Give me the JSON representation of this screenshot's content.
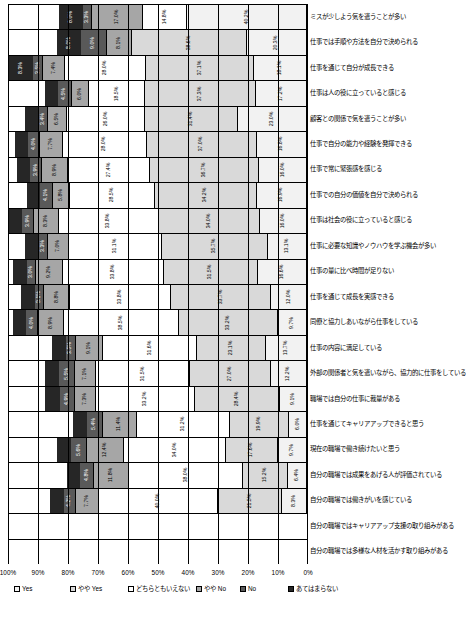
{
  "chart_data": {
    "type": "bar",
    "orientation": "stacked-horizontal-rotated",
    "title": "",
    "xlabel": "",
    "ylabel": "",
    "xlim": [
      0,
      100
    ],
    "grid": true,
    "legend_position": "bottom",
    "axis_ticks": [
      "0%",
      "10%",
      "20%",
      "30%",
      "40%",
      "50%",
      "60%",
      "70%",
      "80%",
      "90%",
      "100%"
    ],
    "legend": [
      "Yes",
      "やや Yes",
      "どちらともいえない",
      "やや No",
      "No",
      "あてはまらない"
    ],
    "categories": [
      "ミスが少しよう気を遣うことが多い",
      "仕事では手順や方法を自分で決められる",
      "仕事を通じて自分が成長できる",
      "仕事は人の役に立っていると感じる",
      "顧客との関係で気を遣うことが多い",
      "仕事で自分の能力や経験を発揮できる",
      "仕事で常に緊張感を感じる",
      "仕事での自分の価値を自分で決められる",
      "仕事は社会の役に立っていると感じる",
      "仕事に必要な知識やノウハウを学ぶ機会が多い",
      "仕事の量に比べ時間が足りない",
      "仕事を通じて成長を実感できる",
      "同僚と協力しあいながら仕事をしている",
      "仕事の内容に満足している",
      "外部の関係者と気を遣いながら、協力的に仕事をしている",
      "職場では自分の仕事に裁量がある",
      "仕事を通じてキャリアアップできると思う",
      "現在の職場で働き続けたいと思う",
      "自分の職場では成果をあげる人が評価されている",
      "自分の職場では働きがいを感じている",
      "自分の職場ではキャリアアップ支援の取り組みがある",
      "自分の職場では多様な人材を活かす取り組みがある"
    ],
    "series": [
      {
        "name": "Yes",
        "values": [
          40.2,
          20.3,
          18.1,
          17.2,
          23.0,
          16.8,
          16.0,
          16.9,
          16.0,
          13.1,
          16.6,
          12.0,
          9.7,
          13.7,
          12.2,
          9.1,
          6.0,
          9.7,
          6.4,
          8.3,
          0,
          0
        ]
      },
      {
        "name": "やや Yes",
        "values": [
          0,
          38.6,
          37.1,
          37.3,
          31.4,
          37.0,
          36.7,
          34.2,
          34.0,
          35.7,
          31.5,
          33.7,
          33.2,
          23.1,
          27.0,
          28.4,
          19.9,
          17.6,
          15.2,
          21.5,
          0,
          0
        ]
      },
      {
        "name": "どちらともいえない",
        "values": [
          14.8,
          0,
          28.0,
          18.5,
          26.0,
          28.0,
          27.4,
          28.5,
          33.8,
          31.1,
          33.8,
          33.8,
          38.5,
          31.6,
          31.5,
          33.2,
          31.2,
          34.0,
          38.0,
          40.0,
          0,
          0
        ]
      },
      {
        "name": "やや No",
        "values": [
          17.0,
          8.1,
          7.4,
          6.0,
          6.5,
          7.7,
          8.9,
          5.8,
          8.3,
          7.0,
          9.2,
          8.8,
          8.9,
          9.1,
          7.1,
          7.3,
          11.4,
          12.4,
          11.8,
          7.7,
          0,
          0
        ]
      },
      {
        "name": "No",
        "values": [
          3.3,
          9.0,
          3.5,
          4.5,
          3.4,
          4.0,
          3.9,
          4.1,
          3.9,
          3.3,
          3.0,
          3.1,
          4.0,
          3.5,
          5.5,
          4.9,
          5.4,
          5.6,
          4.8,
          4.2,
          0,
          0
        ]
      },
      {
        "name": "あてはまらない",
        "values": [
          8.0,
          8.0,
          8.3,
          4.5,
          4.5,
          4.5,
          4.5,
          4.5,
          4.5,
          4.5,
          4.5,
          4.5,
          4.5,
          4.5,
          4.5,
          4.9,
          4.5,
          4.5,
          4.5,
          4.5,
          0,
          0
        ]
      }
    ],
    "bar_labels": [
      [
        "40.2%",
        "",
        "14.8%",
        "17.0%",
        "3.3%",
        "8.0%"
      ],
      [
        "20.3%",
        "38.6%",
        "",
        "8.1%",
        "9.0%",
        "8.0%"
      ],
      [
        "18.1%",
        "37.1%",
        "28.0%",
        "7.4%",
        "3.5%",
        "8.3%"
      ],
      [
        "17.2%",
        "37.3%",
        "18.5%",
        "6.0%",
        "4.5%",
        ""
      ],
      [
        "23.0%",
        "31.4%",
        "26.0%",
        "6.5%",
        "3.4%",
        ""
      ],
      [
        "16.8%",
        "37.0%",
        "28.0%",
        "7.7%",
        "4.0%",
        ""
      ],
      [
        "16.0%",
        "36.7%",
        "27.4%",
        "8.9%",
        "3.9%",
        ""
      ],
      [
        "16.9%",
        "34.2%",
        "28.5%",
        "5.8%",
        "4.1%",
        ""
      ],
      [
        "16.0%",
        "34.0%",
        "33.8%",
        "8.3%",
        "3.9%",
        ""
      ],
      [
        "13.1%",
        "35.7%",
        "31.1%",
        "7.0%",
        "3.3%",
        ""
      ],
      [
        "16.6%",
        "31.5%",
        "33.8%",
        "9.2%",
        "3.0%",
        ""
      ],
      [
        "12.0%",
        "33.7%",
        "33.8%",
        "8.8%",
        "3.1%",
        ""
      ],
      [
        "9.7%",
        "33.2%",
        "38.5%",
        "8.9%",
        "4.0%",
        ""
      ],
      [
        "13.7%",
        "23.1%",
        "31.6%",
        "9.1%",
        "3.5%",
        ""
      ],
      [
        "12.2%",
        "27.0%",
        "31.5%",
        "7.1%",
        "5.5%",
        ""
      ],
      [
        "9.1%",
        "28.4%",
        "33.2%",
        "7.3%",
        "4.9%",
        ""
      ],
      [
        "6.0%",
        "19.9%",
        "31.2%",
        "11.4%",
        "5.4%",
        ""
      ],
      [
        "9.7%",
        "17.6%",
        "34.0%",
        "12.4%",
        "5.6%",
        ""
      ],
      [
        "6.4%",
        "15.2%",
        "38.0%",
        "11.8%",
        "4.8%",
        ""
      ],
      [
        "8.3%",
        "21.5%",
        "40.0%",
        "7.7%",
        "4.2%",
        ""
      ]
    ]
  },
  "colors": {
    "yes": "#f2f2f2",
    "yaya_yes": "#d9d9d9",
    "neutral": "#ffffff",
    "yaya_no": "#a6a6a6",
    "no": "#595959",
    "na": "#262626"
  }
}
